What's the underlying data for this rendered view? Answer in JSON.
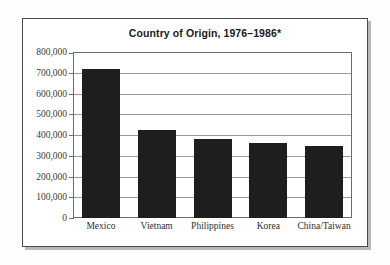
{
  "chart_data": {
    "type": "bar",
    "title": "Country of Origin, 1976–1986*",
    "xlabel": "",
    "ylabel": "",
    "categories": [
      "Mexico",
      "Vietnam",
      "Philippines",
      "Korea",
      "China/Taiwan"
    ],
    "values": [
      720000,
      425000,
      380000,
      360000,
      345000
    ],
    "ylim": [
      0,
      800000
    ],
    "ytick_values": [
      0,
      100000,
      200000,
      300000,
      400000,
      500000,
      600000,
      700000,
      800000
    ],
    "ytick_labels": [
      "0",
      "100,000",
      "200,000",
      "300,000",
      "400,000",
      "500,000",
      "600,000",
      "700,000",
      "800,000"
    ],
    "grid": true,
    "legend": false,
    "bar_color": "#1e1e1e",
    "grid_color": "#9a9a9a",
    "axis_color": "#6d6d6d",
    "background_color": "#ffffff"
  }
}
